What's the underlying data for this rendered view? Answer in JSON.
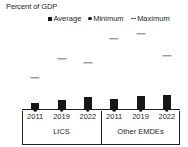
{
  "chart_data": {
    "type": "bar",
    "title": "Percent of GDP",
    "xlabel": "",
    "ylabel": "Percent of GDP",
    "ylim": [
      0,
      12
    ],
    "yticks": [
      0,
      2,
      4,
      6,
      8,
      10,
      12
    ],
    "grid": false,
    "legend_position": "top",
    "categories": [
      "2011",
      "2019",
      "2022",
      "2011",
      "2019",
      "2022"
    ],
    "groups": [
      {
        "label": "LICS",
        "categories": [
          "2011",
          "2019",
          "2022"
        ]
      },
      {
        "label": "Other EMDEs",
        "categories": [
          "2011",
          "2019",
          "2022"
        ]
      }
    ],
    "series": [
      {
        "name": "Average",
        "marker": "square",
        "values": [
          0.9,
          1.4,
          1.8,
          1.5,
          1.9,
          2.0
        ]
      },
      {
        "name": "Minimum",
        "marker": "dot",
        "values": [
          0.0,
          0.0,
          0.0,
          0.0,
          0.0,
          0.0
        ]
      },
      {
        "name": "Maximum",
        "marker": "dash",
        "values": [
          4.3,
          6.8,
          6.3,
          9.5,
          10.2,
          7.2
        ]
      }
    ],
    "colors": {
      "average": "#17171a",
      "minimum": "#17171a",
      "maximum": "#6d6e71",
      "axis": "#231f20"
    }
  },
  "legend": {
    "items": [
      {
        "label": "Average",
        "marker": "square-marker"
      },
      {
        "label": "Minimum",
        "marker": "dot-marker"
      },
      {
        "label": "Maximum",
        "marker": "dash-marker"
      }
    ]
  }
}
